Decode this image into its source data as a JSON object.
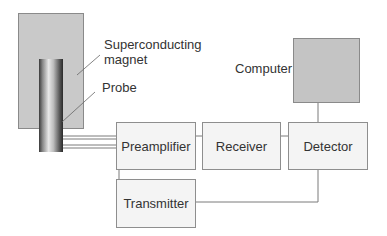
{
  "diagram": {
    "type": "block-diagram",
    "labels": {
      "magnet": "Superconducting magnet",
      "magnet_line1": "Superconducting",
      "magnet_line2": "magnet",
      "probe": "Probe",
      "computer": "Computer"
    },
    "blocks": {
      "preamplifier": "Preamplifier",
      "receiver": "Receiver",
      "detector": "Detector",
      "transmitter": "Transmitter"
    },
    "connections": [
      {
        "from": "Probe",
        "to": "Preamplifier"
      },
      {
        "from": "Preamplifier",
        "to": "Receiver"
      },
      {
        "from": "Receiver",
        "to": "Detector"
      },
      {
        "from": "Detector",
        "to": "Computer"
      },
      {
        "from": "Detector",
        "to": "Transmitter"
      },
      {
        "from": "Transmitter",
        "to": "Preamplifier"
      }
    ],
    "colors": {
      "magnet_fill": "#c9c9c9",
      "computer_fill": "#c4c4c4",
      "box_fill": "#f4f4f4",
      "line": "#7a7a7a"
    }
  }
}
